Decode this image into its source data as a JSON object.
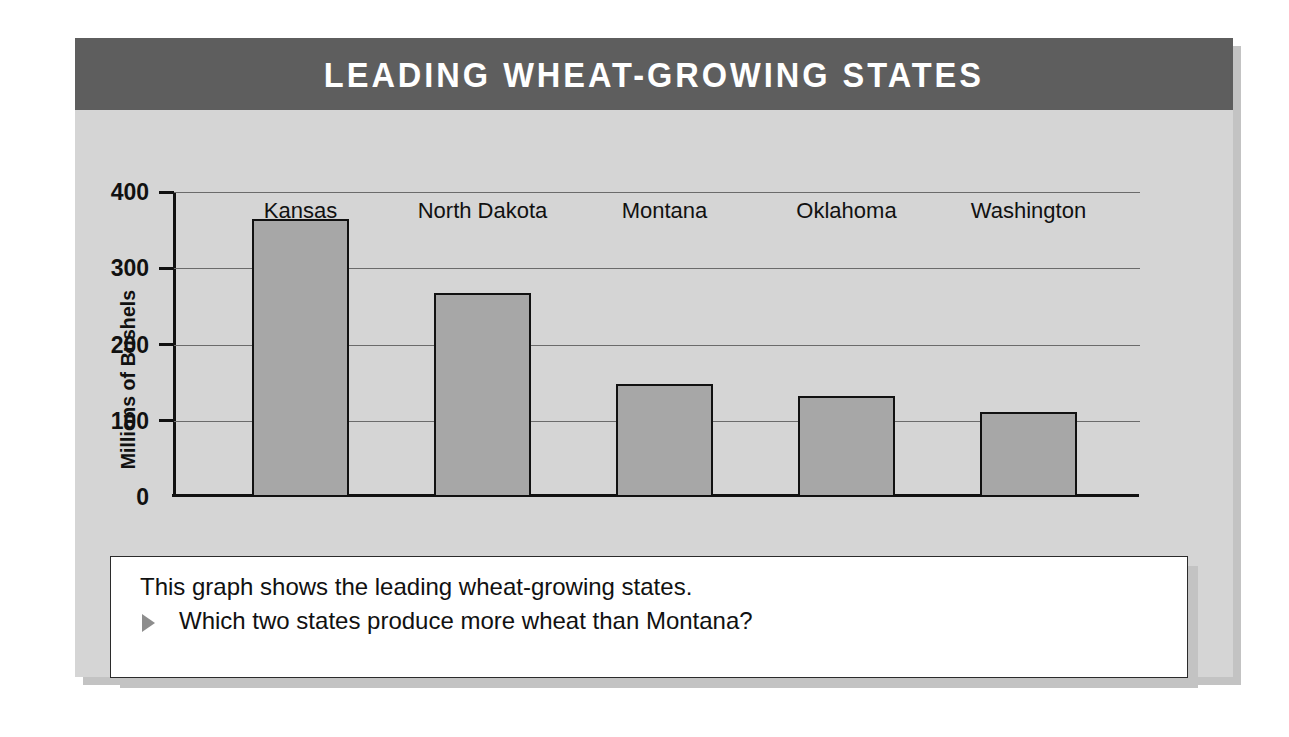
{
  "header": {
    "title": "LEADING WHEAT-GROWING STATES"
  },
  "colors": {
    "title_bar": "#5e5e5e",
    "panel_background": "#d5d5d5",
    "bar_fill": "#a7a7a7",
    "bar_outline": "#111111",
    "caption_background": "#ffffff",
    "bullet": "#8d8d8d"
  },
  "caption": {
    "line1": "This graph shows the leading wheat-growing states.",
    "question": "Which two states produce more wheat than Montana?",
    "bullet_icon": "triangle-right-icon"
  },
  "chart_data": {
    "type": "bar",
    "title": "LEADING WHEAT-GROWING STATES",
    "xlabel": "",
    "ylabel": "Millions of Bushels",
    "categories": [
      "Kansas",
      "North Dakota",
      "Montana",
      "Oklahoma",
      "Washington"
    ],
    "values": [
      365,
      267,
      148,
      132,
      112
    ],
    "ylim": [
      0,
      400
    ],
    "yticks": [
      0,
      100,
      200,
      300,
      400
    ],
    "ytick_labels": [
      "0",
      "100",
      "200",
      "300",
      "400"
    ],
    "grid": true,
    "legend": false
  }
}
